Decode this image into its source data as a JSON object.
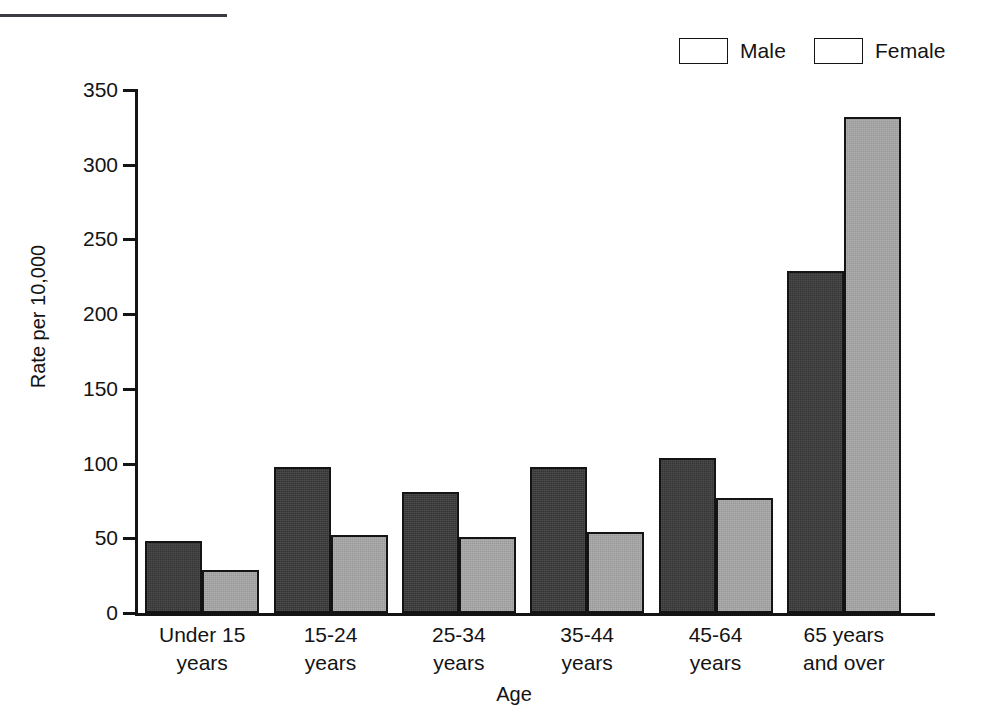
{
  "page": {
    "top_caption": "",
    "background": "#ffffff"
  },
  "chart_data": {
    "type": "bar",
    "title": "",
    "xlabel": "Age",
    "ylabel": "Rate per 10,000",
    "categories": [
      "Under 15\nyears",
      "15-24\nyears",
      "25-34\nyears",
      "35-44\nyears",
      "45-64\nyears",
      "65 years\nand over"
    ],
    "series": [
      {
        "name": "Male",
        "color": "#3a3a3a",
        "values": [
          48,
          98,
          81,
          98,
          104,
          229
        ]
      },
      {
        "name": "Female",
        "color": "#a8a8a8",
        "values": [
          29,
          52,
          51,
          54,
          77,
          332
        ]
      }
    ],
    "ylim": [
      0,
      350
    ],
    "yticks": [
      0,
      50,
      100,
      150,
      200,
      250,
      300,
      350
    ],
    "ytick_labels": [
      "0",
      "50",
      "100",
      "150",
      "200",
      "250",
      "300",
      "350"
    ],
    "grid": false,
    "legend_position": "top-right",
    "legend_entries": [
      "Male",
      "Female"
    ]
  },
  "colors": {
    "male": "#3a3a3a",
    "female": "#a8a8a8",
    "axis": "#141414",
    "text": "#131313"
  }
}
